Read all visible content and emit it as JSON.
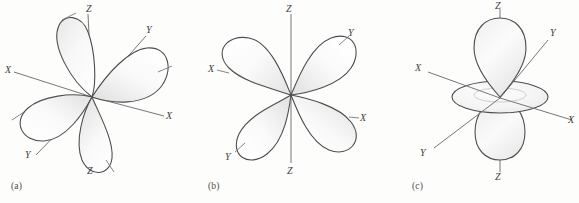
{
  "figure": {
    "background_color": "#fdfdfc",
    "outline_color": "#4d4d4d",
    "axis_color": "#6f6f74",
    "label_color": "#3d3d3d",
    "width": 579,
    "height": 203
  },
  "panels": [
    {
      "id": "a",
      "caption": "(a)",
      "orbital": "four-lobe d orbital (lobes between axes, tilted)",
      "origin": {
        "x": 92,
        "y": 97
      },
      "axes": [
        {
          "name": "Z",
          "label": "Z",
          "end_label_top": "Z",
          "end_label_bottom": "Z"
        },
        {
          "name": "X",
          "label": "X"
        },
        {
          "name": "Y",
          "label": "Y"
        }
      ],
      "axis_labels": [
        {
          "text": "Z",
          "x": 86,
          "y": 5
        },
        {
          "text": "X",
          "x": 6,
          "y": 66
        },
        {
          "text": "Y",
          "x": 146,
          "y": 25
        },
        {
          "text": "X",
          "x": 166,
          "y": 111
        },
        {
          "text": "Y",
          "x": 26,
          "y": 150
        },
        {
          "text": "Z",
          "x": 86,
          "y": 166
        }
      ]
    },
    {
      "id": "b",
      "caption": "(b)",
      "orbital": "four-lobe d orbital (lobes along X and Y axes)",
      "origin": {
        "x": 96,
        "y": 95
      },
      "axes": [
        {
          "name": "Z",
          "label": "Z",
          "end_label_top": "Z",
          "end_label_bottom": "Z"
        },
        {
          "name": "X",
          "label": "X"
        },
        {
          "name": "Y",
          "label": "Y"
        }
      ],
      "axis_labels": [
        {
          "text": "Z",
          "x": 90,
          "y": 5
        },
        {
          "text": "X",
          "x": 14,
          "y": 69
        },
        {
          "text": "Y",
          "x": 150,
          "y": 31
        },
        {
          "text": "X",
          "x": 155,
          "y": 114
        },
        {
          "text": "Y",
          "x": 26,
          "y": 153
        },
        {
          "text": "Z",
          "x": 90,
          "y": 166
        }
      ]
    },
    {
      "id": "c",
      "caption": "(c)",
      "orbital": "dz-squared orbital: two lobes along Z with equatorial torus",
      "origin": {
        "x": 110,
        "y": 97
      },
      "torus": {
        "cx": 110,
        "cy": 97,
        "rx": 48,
        "ry": 16
      },
      "axes": [
        {
          "name": "Z",
          "label": "Z",
          "end_label_top": "Z",
          "end_label_bottom": "Z"
        },
        {
          "name": "X",
          "label": "X"
        },
        {
          "name": "Y",
          "label": "Y"
        }
      ],
      "axis_labels": [
        {
          "text": "Z",
          "x": 105,
          "y": 4
        },
        {
          "text": "X",
          "x": 26,
          "y": 65
        },
        {
          "text": "Y",
          "x": 160,
          "y": 26
        },
        {
          "text": "X",
          "x": 175,
          "y": 112
        },
        {
          "text": "Y",
          "x": 27,
          "y": 148
        },
        {
          "text": "Z",
          "x": 105,
          "y": 170
        }
      ]
    }
  ]
}
